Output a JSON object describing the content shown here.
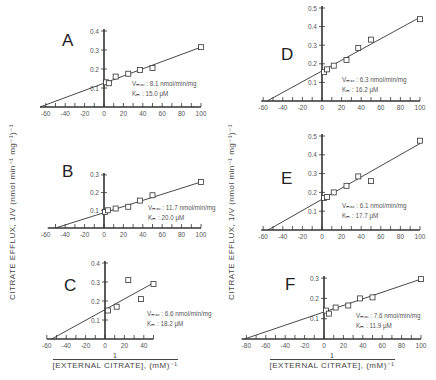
{
  "figure": {
    "y_axis_label": "CITRATE EFFLUX,  1/V (nmol  min⁻¹  mg⁻¹)⁻¹",
    "x_axis_label_numerator": "1",
    "x_axis_label_denominator": "[EXTERNAL CITRATE], (mM)⁻¹"
  },
  "chart_data": [
    {
      "type": "scatter",
      "panel": "A",
      "title": "A",
      "xlabel": "1/[External Citrate], (mM)^-1",
      "ylabel": "1/V (nmol min^-1 mg^-1)^-1",
      "xlim": [
        -65,
        100
      ],
      "ylim": [
        0,
        0.4
      ],
      "xticks": [
        -60,
        -40,
        -20,
        0,
        20,
        40,
        60,
        80,
        100
      ],
      "yticks": [
        0.1,
        0.2,
        0.3,
        0.4
      ],
      "points": [
        [
          2,
          0.13
        ],
        [
          5,
          0.125
        ],
        [
          12,
          0.16
        ],
        [
          25,
          0.175
        ],
        [
          37,
          0.195
        ],
        [
          50,
          0.205
        ],
        [
          100,
          0.315
        ]
      ],
      "fit_line": {
        "x": [
          -66,
          100
        ],
        "y": [
          0,
          0.315
        ]
      },
      "annotation": {
        "vmax": "Vₘₐₓ : 8.1 nmol/min/mg",
        "km": "Kₘ : 15.0 μM"
      }
    },
    {
      "type": "scatter",
      "panel": "B",
      "title": "B",
      "xlim": [
        -60,
        100
      ],
      "ylim": [
        0,
        0.3
      ],
      "xticks": [
        -60,
        -40,
        -20,
        0,
        20,
        40,
        60,
        80,
        100
      ],
      "yticks": [
        0.1,
        0.2,
        0.3
      ],
      "points": [
        [
          1,
          0.09
        ],
        [
          4,
          0.1
        ],
        [
          12,
          0.11
        ],
        [
          25,
          0.12
        ],
        [
          37,
          0.155
        ],
        [
          50,
          0.185
        ],
        [
          100,
          0.26
        ]
      ],
      "fit_line": {
        "x": [
          -50,
          100
        ],
        "y": [
          0,
          0.26
        ]
      },
      "annotation": {
        "vmax": "Vₘₐₓ : 11.7 nmol/min/mg",
        "km": "Kₘ : 20.0 μM"
      }
    },
    {
      "type": "scatter",
      "panel": "C",
      "title": "C",
      "xlim": [
        -60,
        50
      ],
      "ylim": [
        0,
        0.4
      ],
      "xticks": [
        -60,
        -40,
        -20,
        0,
        20,
        40
      ],
      "yticks": [
        0.1,
        0.2,
        0.3,
        0.4
      ],
      "points": [
        [
          3,
          0.15
        ],
        [
          12,
          0.17
        ],
        [
          24,
          0.31
        ],
        [
          37,
          0.21
        ],
        [
          50,
          0.29
        ]
      ],
      "fit_line": {
        "x": [
          -55,
          50
        ],
        "y": [
          0,
          0.295
        ]
      },
      "annotation": {
        "vmax": "Vₘₐₓ : 6.6 nmol/min/mg",
        "km": "Kₘ : 18.2 μM"
      }
    },
    {
      "type": "scatter",
      "panel": "D",
      "title": "D",
      "xlim": [
        -60,
        100
      ],
      "ylim": [
        0,
        0.5
      ],
      "xticks": [
        -60,
        -40,
        -20,
        0,
        20,
        40,
        60,
        80,
        100
      ],
      "yticks": [
        0.1,
        0.2,
        0.3,
        0.4,
        0.5
      ],
      "points": [
        [
          2,
          0.155
        ],
        [
          5,
          0.17
        ],
        [
          12,
          0.19
        ],
        [
          25,
          0.22
        ],
        [
          37,
          0.285
        ],
        [
          50,
          0.33
        ],
        [
          100,
          0.44
        ]
      ],
      "fit_line": {
        "x": [
          -56,
          100
        ],
        "y": [
          0,
          0.45
        ]
      },
      "annotation": {
        "vmax": "Vₘₐₓ : 6.3 nmol/min/mg",
        "km": "Kₘ : 16.2 μM"
      }
    },
    {
      "type": "scatter",
      "panel": "E",
      "title": "E",
      "xlim": [
        -60,
        100
      ],
      "ylim": [
        0,
        0.5
      ],
      "xticks": [
        -60,
        -40,
        -20,
        0,
        20,
        40,
        60,
        80,
        100
      ],
      "yticks": [
        0.1,
        0.2,
        0.3,
        0.4,
        0.5
      ],
      "points": [
        [
          2,
          0.17
        ],
        [
          5,
          0.175
        ],
        [
          12,
          0.2
        ],
        [
          25,
          0.235
        ],
        [
          37,
          0.285
        ],
        [
          50,
          0.26
        ],
        [
          100,
          0.475
        ]
      ],
      "fit_line": {
        "x": [
          -55,
          100
        ],
        "y": [
          0,
          0.46
        ]
      },
      "annotation": {
        "vmax": "Vₘₐₓ : 6.1 nmol/min/mg",
        "km": "Kₘ : 17.7 μM"
      }
    },
    {
      "type": "scatter",
      "panel": "F",
      "title": "F",
      "xlim": [
        -80,
        100
      ],
      "ylim": [
        0,
        0.3
      ],
      "xticks": [
        -80,
        -60,
        -40,
        -20,
        0,
        20,
        40,
        60,
        80,
        100
      ],
      "yticks": [
        0.1,
        0.2,
        0.3
      ],
      "points": [
        [
          2,
          0.14
        ],
        [
          5,
          0.125
        ],
        [
          12,
          0.155
        ],
        [
          25,
          0.165
        ],
        [
          37,
          0.2
        ],
        [
          50,
          0.205
        ],
        [
          100,
          0.295
        ]
      ],
      "fit_line": {
        "x": [
          -82,
          100
        ],
        "y": [
          0,
          0.295
        ]
      },
      "annotation": {
        "vmax": "Vₘₐₓ : 7.6 nmol/min/mg",
        "km": "Kₘ : 11.9 μM"
      }
    }
  ],
  "layout": {
    "panels": [
      {
        "ox": 104,
        "oy": 107,
        "sx": 0.97,
        "sy": 190,
        "xmin": -66,
        "xmax": 100,
        "ytop": 0.4,
        "label_x": 62,
        "label_y": 46,
        "ann_x": 132,
        "ann_y": 86
      },
      {
        "ox": 104,
        "oy": 228,
        "sx": 0.97,
        "sy": 177,
        "xmin": -58,
        "xmax": 100,
        "ytop": 0.3,
        "label_x": 62,
        "label_y": 177,
        "ann_x": 148,
        "ann_y": 210
      },
      {
        "ox": 105,
        "oy": 339,
        "sx": 0.97,
        "sy": 190,
        "xmin": -60,
        "xmax": 50,
        "ytop": 0.4,
        "label_x": 64,
        "label_y": 291,
        "ann_x": 147,
        "ann_y": 316
      },
      {
        "ox": 322,
        "oy": 101,
        "sx": 0.98,
        "sy": 186,
        "xmin": -62,
        "xmax": 100,
        "ytop": 0.5,
        "label_x": 281,
        "label_y": 60,
        "ann_x": 342,
        "ann_y": 82
      },
      {
        "ox": 322,
        "oy": 230,
        "sx": 0.98,
        "sy": 188,
        "xmin": -62,
        "xmax": 100,
        "ytop": 0.5,
        "label_x": 281,
        "label_y": 184,
        "ann_x": 342,
        "ann_y": 208
      },
      {
        "ox": 324,
        "oy": 339,
        "sx": 0.97,
        "sy": 203,
        "xmin": -85,
        "xmax": 100,
        "ytop": 0.3,
        "label_x": 285,
        "label_y": 290,
        "ann_x": 356,
        "ann_y": 318
      }
    ]
  }
}
